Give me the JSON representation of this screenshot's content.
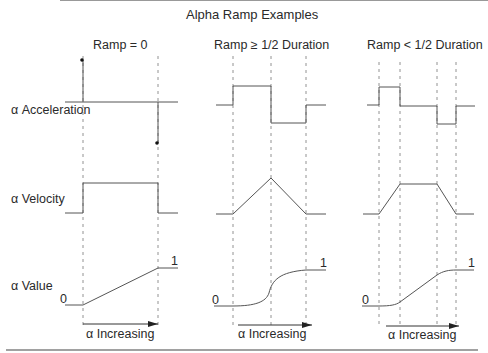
{
  "title": "Alpha Ramp Examples",
  "row_labels": {
    "acceleration": "α Acceleration",
    "velocity": "α Velocity",
    "value": "α Value"
  },
  "panels": [
    {
      "heading": "Ramp = 0",
      "value_start_label": "0",
      "value_end_label": "1",
      "arrow_label": "α Increasing"
    },
    {
      "heading": "Ramp ≥ 1/2 Duration",
      "value_start_label": "0",
      "value_end_label": "1",
      "arrow_label": "α Increasing"
    },
    {
      "heading": "Ramp < 1/2 Duration",
      "value_start_label": "0",
      "value_end_label": "1",
      "arrow_label": "α Increasing"
    }
  ],
  "colors": {
    "line": "#555555",
    "dashed": "#777777",
    "text": "#2a2a2a",
    "background": "#ffffff"
  }
}
